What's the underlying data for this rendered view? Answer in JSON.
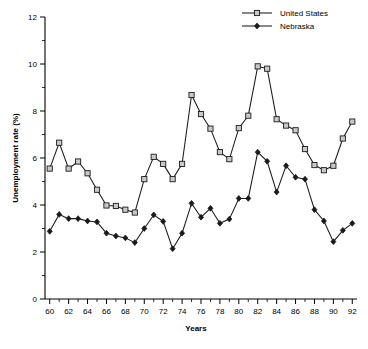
{
  "chart_data": {
    "type": "line",
    "title": "",
    "xlabel": "Years",
    "ylabel": "Unemployment rate (%)",
    "xlim": [
      59.5,
      92.5
    ],
    "ylim": [
      0,
      12
    ],
    "x_ticks": [
      60,
      62,
      64,
      66,
      68,
      70,
      72,
      74,
      76,
      78,
      80,
      82,
      84,
      86,
      88,
      90,
      92
    ],
    "x_minor_ticks": [
      61,
      63,
      65,
      67,
      69,
      71,
      73,
      75,
      77,
      79,
      81,
      83,
      85,
      87,
      89,
      91
    ],
    "y_ticks": [
      0,
      2,
      4,
      6,
      8,
      10,
      12
    ],
    "y_minor_ticks": [
      1,
      3,
      5,
      7,
      9,
      11
    ],
    "grid": false,
    "legend_position": "top-right",
    "x": [
      60,
      61,
      62,
      63,
      64,
      65,
      66,
      67,
      68,
      69,
      70,
      71,
      72,
      73,
      74,
      75,
      76,
      77,
      78,
      79,
      80,
      81,
      82,
      83,
      84,
      85,
      86,
      87,
      88,
      89,
      90,
      91,
      92
    ],
    "series": [
      {
        "name": "United States",
        "marker": "open-square",
        "values": [
          5.55,
          6.65,
          5.55,
          5.85,
          5.35,
          4.65,
          3.98,
          3.96,
          3.8,
          3.68,
          5.1,
          6.05,
          5.75,
          5.1,
          5.75,
          8.68,
          7.87,
          7.25,
          6.25,
          5.95,
          7.27,
          7.8,
          9.9,
          9.8,
          7.65,
          7.38,
          7.18,
          6.38,
          5.7,
          5.48,
          5.67,
          6.83,
          7.55
        ]
      },
      {
        "name": "Nebraska",
        "marker": "filled-diamond",
        "values": [
          2.88,
          3.6,
          3.42,
          3.42,
          3.32,
          3.28,
          2.8,
          2.68,
          2.6,
          2.4,
          3.0,
          3.58,
          3.3,
          2.14,
          2.8,
          4.07,
          3.48,
          3.86,
          3.22,
          3.4,
          4.28,
          4.28,
          6.25,
          5.86,
          4.55,
          5.67,
          5.18,
          5.1,
          3.8,
          3.32,
          2.44,
          2.92,
          3.22
        ]
      }
    ]
  },
  "legend": {
    "items": [
      {
        "label": "United States"
      },
      {
        "label": "Nebraska"
      }
    ]
  },
  "colors": {
    "line": "#1a1a1a",
    "marker_open_fill": "#c9c9c9",
    "axis": "#000000",
    "background": "#ffffff"
  }
}
